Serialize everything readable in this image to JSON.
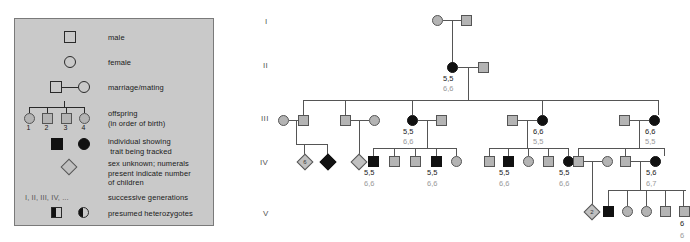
{
  "legend": {
    "title": "Pedigree symbol key",
    "entries": [
      {
        "symbol": "square-open",
        "label": "male"
      },
      {
        "symbol": "circle-open",
        "label": "female"
      },
      {
        "symbol": "square-circle-joined",
        "label": "marriage/mating"
      },
      {
        "symbol": "sibship-four",
        "label": "offspring\n(in order of birth)",
        "numbers": [
          "1",
          "2",
          "3",
          "4"
        ]
      },
      {
        "symbol": "filled-square-filled-circle",
        "label": "individual showing\n trait being tracked"
      },
      {
        "symbol": "diamond",
        "label": "sex unknown; numerals\npresent indicate number\nof children"
      },
      {
        "symbol": "roman-numerals",
        "glyph": "I, II, III, IV, ...",
        "label": "successive generations"
      },
      {
        "symbol": "half-filled-square-half-filled-circle",
        "label": "presumed heterozygotes"
      }
    ]
  },
  "pedigree": {
    "generation_labels": [
      "I",
      "II",
      "III",
      "IV",
      "V"
    ],
    "genotypes": {
      "II_1_top": "5,5",
      "II_1_bottom": "6,6",
      "III_3_top": "5,5",
      "III_3_bottom": "6,6",
      "III_5_top": "6,6",
      "III_5_bottom": "5,5",
      "III_7_top": "6,6",
      "III_7_bottom": "5,5",
      "IV_a_top": "5,5",
      "IV_a_bottom": "6,6",
      "IV_b_top": "5,5",
      "IV_b_bottom": "6,6",
      "IV_c_top": "5,5",
      "IV_c_bottom": "6,6",
      "IV_d_top": "5,5",
      "IV_d_bottom": "6,6",
      "IV_e_top": "5,6",
      "IV_e_bottom": "6,7",
      "V_edge_top": "6",
      "V_edge_bottom": "6"
    },
    "diamond_counts": {
      "IV_diamond_1": "6",
      "IV_diamond_2": "",
      "V_diamond_1": "2"
    }
  },
  "colors": {
    "legend_background": "#c9c9c9",
    "legend_border": "#7a7a7a",
    "affected_fill": "#111111",
    "unaffected_fill": "#b4b4b4",
    "line": "#555555",
    "genotype_primary": "#222222",
    "genotype_secondary": "#9a9a9a"
  }
}
